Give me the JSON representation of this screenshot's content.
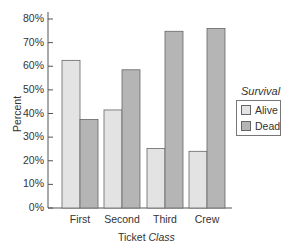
{
  "chart_data": {
    "type": "bar",
    "title": "",
    "xlabel": "Ticket Class",
    "xlabel_parts": {
      "plain": "Ticket ",
      "italic": "Class"
    },
    "ylabel": "Percent",
    "ylim": [
      0,
      80
    ],
    "yticks": [
      "0%",
      "10%",
      "20%",
      "30%",
      "40%",
      "50%",
      "60%",
      "70%",
      "80%"
    ],
    "categories": [
      "First",
      "Second",
      "Third",
      "Crew"
    ],
    "series": [
      {
        "name": "Alive",
        "color": "#e3e3e3",
        "values": [
          62.5,
          41.5,
          25.2,
          24.0
        ]
      },
      {
        "name": "Dead",
        "color": "#b5b5b5",
        "values": [
          37.5,
          58.5,
          74.8,
          76.0
        ]
      }
    ],
    "legend": {
      "title": "Survival",
      "position": "right",
      "entries": [
        "Alive",
        "Dead"
      ]
    },
    "grid": false
  }
}
